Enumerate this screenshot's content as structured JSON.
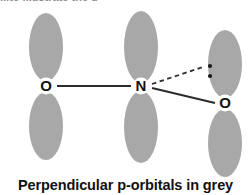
{
  "figure": {
    "caption": "Perpendicular p-orbitals in grey",
    "cut_off_header": "...to illustrate the g",
    "background_color": "#ffffff",
    "orbital_color": "#a8a8a8",
    "bond_color": "#2b2b2b",
    "label_color": "#111111"
  },
  "atoms": [
    {
      "id": "o-left",
      "label": "O",
      "cx": 46,
      "cy": 86
    },
    {
      "id": "n-center",
      "label": "N",
      "cx": 141,
      "cy": 86
    },
    {
      "id": "o-right",
      "label": "O",
      "cx": 225,
      "cy": 103
    }
  ],
  "orbitals": [
    {
      "id": "o-left-upper-lobe",
      "atom": "o-left",
      "cx": 46,
      "cy": 47,
      "rx": 17,
      "ry": 34
    },
    {
      "id": "o-left-lower-lobe",
      "atom": "o-left",
      "cx": 46,
      "cy": 126,
      "rx": 17,
      "ry": 34
    },
    {
      "id": "n-upper-lobe",
      "atom": "n-center",
      "cx": 141,
      "cy": 47,
      "rx": 17,
      "ry": 36
    },
    {
      "id": "n-lower-lobe",
      "atom": "n-center",
      "cx": 141,
      "cy": 127,
      "rx": 17,
      "ry": 36
    },
    {
      "id": "o-right-upper-lobe",
      "atom": "o-right",
      "cx": 225,
      "cy": 64,
      "rx": 17,
      "ry": 34
    },
    {
      "id": "o-right-lower-lobe",
      "atom": "o-right",
      "cx": 225,
      "cy": 143,
      "rx": 17,
      "ry": 34
    }
  ],
  "bonds": [
    {
      "id": "bond-o-left-n",
      "style": "solid",
      "x1": 57,
      "y1": 86,
      "x2": 131,
      "y2": 86
    },
    {
      "id": "bond-n-lonepair",
      "style": "dashed",
      "x1": 152,
      "y1": 84,
      "x2": 203,
      "y2": 67
    },
    {
      "id": "bond-n-o-right",
      "style": "solid",
      "x1": 152,
      "y1": 88,
      "x2": 215,
      "y2": 103
    }
  ],
  "lone_pair": {
    "id": "lone-pair-dots",
    "dots": [
      {
        "cx": 210,
        "cy": 66,
        "r": 2.1
      },
      {
        "cx": 210,
        "cy": 76,
        "r": 2.1
      }
    ]
  }
}
